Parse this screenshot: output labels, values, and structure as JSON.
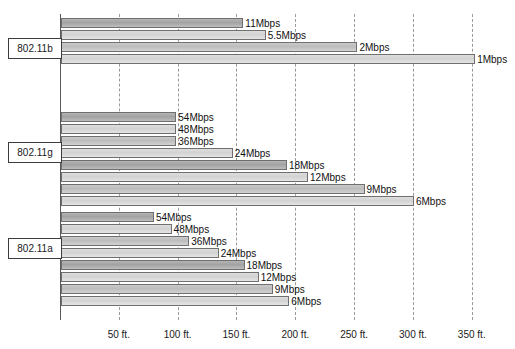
{
  "chart_data": {
    "type": "bar",
    "title": "",
    "xlabel": "",
    "ylabel": "",
    "orientation": "horizontal",
    "grid": true,
    "legend": "none",
    "xlim": [
      0,
      387
    ],
    "x_unit": "ft.",
    "x_ticks": [
      {
        "value": 50,
        "label": "50 ft."
      },
      {
        "value": 100,
        "label": "100 ft."
      },
      {
        "value": 150,
        "label": "150 ft."
      },
      {
        "value": 200,
        "label": "200 ft."
      },
      {
        "value": 250,
        "label": "250 ft."
      },
      {
        "value": 300,
        "label": "300 ft."
      },
      {
        "value": 350,
        "label": "350 ft."
      }
    ],
    "groups": [
      {
        "name": "802.11b",
        "bars": [
          {
            "label": "11Mbps",
            "rate_mbps": 11,
            "range_ft": 155
          },
          {
            "label": "5.5Mbps",
            "rate_mbps": 5.5,
            "range_ft": 174
          },
          {
            "label": "2Mbps",
            "rate_mbps": 2,
            "range_ft": 252
          },
          {
            "label": "1Mbps",
            "rate_mbps": 1,
            "range_ft": 352
          }
        ]
      },
      {
        "name": "802.11g",
        "bars": [
          {
            "label": "54Mbps",
            "rate_mbps": 54,
            "range_ft": 98
          },
          {
            "label": "48Mbps",
            "rate_mbps": 48,
            "range_ft": 98
          },
          {
            "label": "36Mbps",
            "rate_mbps": 36,
            "range_ft": 98
          },
          {
            "label": "24Mbps",
            "rate_mbps": 24,
            "range_ft": 146
          },
          {
            "label": "18Mbps",
            "rate_mbps": 18,
            "range_ft": 192
          },
          {
            "label": "12Mbps",
            "rate_mbps": 12,
            "range_ft": 210
          },
          {
            "label": "9Mbps",
            "rate_mbps": 9,
            "range_ft": 258
          },
          {
            "label": "6Mbps",
            "rate_mbps": 6,
            "range_ft": 300
          }
        ]
      },
      {
        "name": "802.11a",
        "bars": [
          {
            "label": "54Mbps",
            "rate_mbps": 54,
            "range_ft": 79
          },
          {
            "label": "48Mbps",
            "rate_mbps": 48,
            "range_ft": 94
          },
          {
            "label": "36Mbps",
            "rate_mbps": 36,
            "range_ft": 109
          },
          {
            "label": "24Mbps",
            "rate_mbps": 24,
            "range_ft": 134
          },
          {
            "label": "18Mbps",
            "rate_mbps": 18,
            "range_ft": 156
          },
          {
            "label": "12Mbps",
            "rate_mbps": 12,
            "range_ft": 168
          },
          {
            "label": "9Mbps",
            "rate_mbps": 9,
            "range_ft": 180
          },
          {
            "label": "6Mbps",
            "rate_mbps": 6,
            "range_ft": 194
          }
        ]
      }
    ]
  },
  "geometry": {
    "origin_x": 60,
    "px_per_ft": 1.1765,
    "plot_top": 14,
    "plot_bottom": 320,
    "bar_height": 10,
    "group_tops": [
      18,
      112,
      212
    ],
    "bar_pitch": 12,
    "label_box_x": 8,
    "label_box_width": 54,
    "label_box_tops": [
      38,
      142,
      238
    ]
  }
}
